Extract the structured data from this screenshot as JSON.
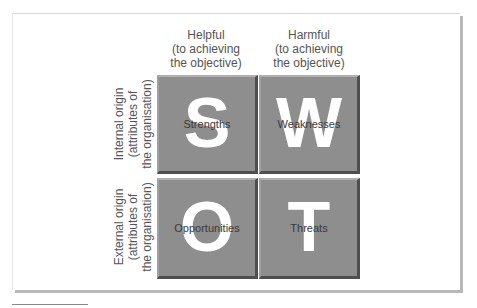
{
  "diagram": {
    "columns": [
      {
        "label": "Helpful\n(to achieving\nthe objective)",
        "lines": [
          "Helpful",
          "(to achieving",
          "the objective)"
        ]
      },
      {
        "label": "Harmful\n(to achieving\nthe objective)",
        "lines": [
          "Harmful",
          "(to achieving",
          "the objective)"
        ]
      }
    ],
    "rows": [
      {
        "lines": [
          "Internal origin",
          "(attributes of",
          "the organisation)"
        ]
      },
      {
        "lines": [
          "External origin",
          "(attributes of",
          "the organisation)"
        ]
      }
    ],
    "quadrants": [
      {
        "letter": "S",
        "label": "Strengths"
      },
      {
        "letter": "W",
        "label": "Weaknesses"
      },
      {
        "letter": "O",
        "label": "Opportunities"
      },
      {
        "letter": "T",
        "label": "Threats"
      }
    ],
    "colors": {
      "quadrant_fill": "#8e8e8e",
      "quadrant_shadow": "#4e4e4e",
      "letter": "#ffffff",
      "text": "#555555",
      "panel_shadow": "#b8b8b8"
    }
  }
}
